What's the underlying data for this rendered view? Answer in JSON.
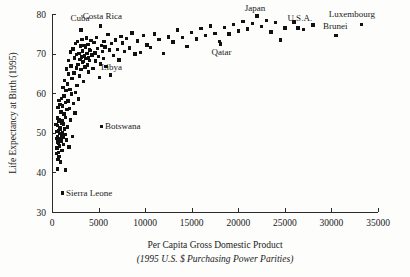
{
  "chart_data": {
    "type": "scatter",
    "title": "",
    "xlabel": "Per Capita Gross Domestic Product",
    "xlabel_sub": "(1995 U.S. $ Purchasing Power Parities)",
    "ylabel": "Life Expectancy at Birth (1995)",
    "xlim": [
      0,
      35000
    ],
    "ylim": [
      30,
      80
    ],
    "xticks": [
      0,
      5000,
      10000,
      15000,
      20000,
      25000,
      30000,
      35000
    ],
    "xtick_labels": [
      "0",
      "5000",
      "10000",
      "15000",
      "20000",
      "25000",
      "30000",
      "35000"
    ],
    "yticks": [
      30,
      40,
      50,
      60,
      70,
      80
    ],
    "ytick_labels": [
      "30",
      "40",
      "50",
      "60",
      "70",
      "80"
    ],
    "grid": false,
    "legend": "none",
    "marker": "square",
    "marker_color": "#111111",
    "points": [
      [
        450,
        52.1
      ],
      [
        480,
        48.6
      ],
      [
        500,
        44.8
      ],
      [
        520,
        50.3
      ],
      [
        540,
        46.2
      ],
      [
        560,
        53.7
      ],
      [
        570,
        40.9
      ],
      [
        590,
        49.1
      ],
      [
        600,
        47.5
      ],
      [
        610,
        51.8
      ],
      [
        630,
        43.2
      ],
      [
        650,
        56.4
      ],
      [
        660,
        48.0
      ],
      [
        680,
        45.1
      ],
      [
        700,
        52.9
      ],
      [
        710,
        50.5
      ],
      [
        730,
        47.3
      ],
      [
        750,
        58.2
      ],
      [
        760,
        44.0
      ],
      [
        780,
        49.8
      ],
      [
        800,
        53.4
      ],
      [
        820,
        46.7
      ],
      [
        840,
        51.2
      ],
      [
        860,
        48.4
      ],
      [
        880,
        57.1
      ],
      [
        900,
        42.6
      ],
      [
        920,
        50.9
      ],
      [
        950,
        55.3
      ],
      [
        970,
        47.9
      ],
      [
        990,
        52.4
      ],
      [
        1010,
        49.3
      ],
      [
        1040,
        58.6
      ],
      [
        1060,
        45.6
      ],
      [
        1080,
        53.0
      ],
      [
        1100,
        50.1
      ],
      [
        1130,
        56.8
      ],
      [
        1160,
        48.9
      ],
      [
        1190,
        61.4
      ],
      [
        1210,
        52.2
      ],
      [
        1240,
        47.1
      ],
      [
        1270,
        54.7
      ],
      [
        1300,
        59.3
      ],
      [
        1330,
        51.0
      ],
      [
        1360,
        63.2
      ],
      [
        1390,
        49.5
      ],
      [
        1420,
        57.6
      ],
      [
        1450,
        40.6
      ],
      [
        1480,
        53.8
      ],
      [
        1510,
        60.7
      ],
      [
        1540,
        66.1
      ],
      [
        1570,
        48.2
      ],
      [
        1600,
        55.9
      ],
      [
        1640,
        62.3
      ],
      [
        1680,
        51.5
      ],
      [
        1720,
        58.0
      ],
      [
        1760,
        64.8
      ],
      [
        1800,
        68.2
      ],
      [
        1840,
        46.4
      ],
      [
        1880,
        56.2
      ],
      [
        1920,
        61.0
      ],
      [
        1960,
        70.4
      ],
      [
        2000,
        53.2
      ],
      [
        2050,
        66.9
      ],
      [
        2100,
        59.8
      ],
      [
        2150,
        63.7
      ],
      [
        2200,
        49.0
      ],
      [
        2250,
        71.2
      ],
      [
        2300,
        57.4
      ],
      [
        2350,
        65.1
      ],
      [
        2400,
        68.9
      ],
      [
        2450,
        55.0
      ],
      [
        2500,
        72.6
      ],
      [
        2550,
        60.2
      ],
      [
        2600,
        66.4
      ],
      [
        2650,
        69.8
      ],
      [
        2700,
        62.0
      ],
      [
        2750,
        73.1
      ],
      [
        2800,
        67.2
      ],
      [
        2850,
        58.5
      ],
      [
        2900,
        70.1
      ],
      [
        2950,
        64.3
      ],
      [
        3000,
        68.5
      ],
      [
        3050,
        71.9
      ],
      [
        3100,
        66.0
      ],
      [
        3150,
        69.1
      ],
      [
        3200,
        73.6
      ],
      [
        3250,
        67.8
      ],
      [
        3300,
        70.7
      ],
      [
        3350,
        63.0
      ],
      [
        3400,
        68.0
      ],
      [
        3450,
        72.0
      ],
      [
        3500,
        69.4
      ],
      [
        3550,
        66.6
      ],
      [
        3600,
        71.5
      ],
      [
        3650,
        68.7
      ],
      [
        3700,
        73.9
      ],
      [
        3750,
        70.0
      ],
      [
        3800,
        67.1
      ],
      [
        3850,
        72.3
      ],
      [
        3900,
        69.0
      ],
      [
        3950,
        65.4
      ],
      [
        4000,
        71.0
      ],
      [
        4050,
        68.3
      ],
      [
        4100,
        70.8
      ],
      [
        4200,
        73.3
      ],
      [
        4300,
        69.6
      ],
      [
        4400,
        66.2
      ],
      [
        4500,
        72.8
      ],
      [
        4600,
        70.2
      ],
      [
        4700,
        68.1
      ],
      [
        4800,
        74.1
      ],
      [
        4900,
        71.3
      ],
      [
        5000,
        69.2
      ],
      [
        5100,
        64.0
      ],
      [
        5200,
        67.4
      ],
      [
        5300,
        72.1
      ],
      [
        5400,
        70.5
      ],
      [
        5500,
        68.8
      ],
      [
        5600,
        73.0
      ],
      [
        5700,
        71.7
      ],
      [
        5800,
        66.8
      ],
      [
        6000,
        74.8
      ],
      [
        6200,
        70.9
      ],
      [
        6400,
        72.5
      ],
      [
        6600,
        69.5
      ],
      [
        6800,
        73.4
      ],
      [
        7000,
        71.1
      ],
      [
        7200,
        68.4
      ],
      [
        7400,
        74.3
      ],
      [
        7600,
        72.7
      ],
      [
        7800,
        70.6
      ],
      [
        8000,
        73.8
      ],
      [
        8300,
        71.4
      ],
      [
        8600,
        75.2
      ],
      [
        8900,
        69.9
      ],
      [
        9200,
        73.2
      ],
      [
        9500,
        70.3
      ],
      [
        9800,
        74.6
      ],
      [
        10200,
        72.2
      ],
      [
        10600,
        71.6
      ],
      [
        11000,
        75.0
      ],
      [
        11500,
        73.5
      ],
      [
        12000,
        70.0
      ],
      [
        12500,
        74.2
      ],
      [
        13000,
        72.9
      ],
      [
        13500,
        76.0
      ],
      [
        14000,
        74.0
      ],
      [
        14500,
        71.8
      ],
      [
        15000,
        75.4
      ],
      [
        15500,
        73.7
      ],
      [
        16000,
        76.3
      ],
      [
        16500,
        74.5
      ],
      [
        17000,
        77.0
      ],
      [
        17500,
        75.1
      ],
      [
        18000,
        73.0
      ],
      [
        18500,
        76.6
      ],
      [
        19000,
        74.9
      ],
      [
        19500,
        77.3
      ],
      [
        20000,
        75.7
      ],
      [
        20500,
        78.1
      ],
      [
        21000,
        76.2
      ],
      [
        21500,
        77.6
      ],
      [
        22000,
        79.4
      ],
      [
        22500,
        76.9
      ],
      [
        23000,
        78.4
      ],
      [
        23500,
        75.5
      ],
      [
        24000,
        77.8
      ],
      [
        24500,
        73.4
      ],
      [
        25000,
        76.5
      ],
      [
        26000,
        78.0
      ],
      [
        27000,
        76.1
      ],
      [
        28000,
        77.2
      ],
      [
        30500,
        74.6
      ],
      [
        33200,
        77.4
      ]
    ],
    "annotations": [
      {
        "label": "Cuba",
        "x": 3100,
        "y": 76.0,
        "lx": 3000,
        "ly": 79.0
      },
      {
        "label": "Costa Rica",
        "x": 5200,
        "y": 77.0,
        "lx": 5400,
        "ly": 79.6
      },
      {
        "label": "Japan",
        "x": 22000,
        "y": 79.6,
        "lx": 21800,
        "ly": 81.5
      },
      {
        "label": "U.S.A.",
        "x": 26400,
        "y": 76.5,
        "lx": 26600,
        "ly": 79.0
      },
      {
        "label": "Luxembourg",
        "x": 33200,
        "y": 77.4,
        "lx": 32200,
        "ly": 79.9
      },
      {
        "label": "Brunei",
        "x": 30500,
        "y": 74.6,
        "lx": 30400,
        "ly": 76.9
      },
      {
        "label": "Qatar",
        "x": 18100,
        "y": 72.4,
        "lx": 18200,
        "ly": 70.3
      },
      {
        "label": "Libya",
        "x": 6300,
        "y": 64.6,
        "lx": 6400,
        "ly": 66.6
      },
      {
        "label": "Botswana",
        "x": 5300,
        "y": 51.6,
        "lx": 5700,
        "ly": 51.6
      },
      {
        "label": "Sierra Leone",
        "x": 1150,
        "y": 34.8,
        "lx": 1500,
        "ly": 34.8
      }
    ]
  },
  "figure": {
    "background_color": "#fdfdfc",
    "axis_color": "#2b2b2b",
    "marker_color": "#111111"
  }
}
